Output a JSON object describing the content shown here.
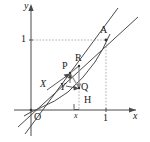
{
  "figure": {
    "background_color": "#ffffff",
    "stroke_color": "#444444",
    "dashed_color": "#9a9a9a",
    "axes": {
      "x_label": "x",
      "y_label": "y",
      "origin_label": "O",
      "x_tick_label": "1",
      "y_tick_label": "1",
      "x_small_label": "x"
    },
    "points": [
      {
        "key": "A",
        "label": "A",
        "x": 106,
        "y": 40,
        "label_x": 101,
        "label_y": 26
      },
      {
        "key": "R",
        "label": "R",
        "x": 79,
        "y": 65,
        "label_x": 76,
        "label_y": 54
      },
      {
        "key": "P",
        "label": "P",
        "x": 70,
        "y": 72,
        "label_x": 64,
        "label_y": 62
      },
      {
        "key": "Q",
        "label": "Q",
        "x": 79,
        "y": 87,
        "label_x": 81,
        "label_y": 82
      },
      {
        "key": "H",
        "label": "H",
        "x": 79,
        "y": 110,
        "label_x": 85,
        "label_y": 96
      },
      {
        "key": "O",
        "label": "O",
        "x": 31,
        "y": 110,
        "label_x": 34,
        "label_y": 113
      }
    ],
    "vectors": [
      {
        "key": "X",
        "label": "X",
        "label_x": 41,
        "label_y": 80,
        "from_x": 47,
        "from_y": 89,
        "to_x": 69,
        "to_y": 75
      },
      {
        "key": "Y",
        "label": "Y",
        "label_x": 61,
        "label_y": 83,
        "from_x": 66,
        "from_y": 86,
        "to_x": 78,
        "to_y": 88
      }
    ],
    "ticks": {
      "y_one_label_x": 21,
      "y_one_label_y": 35,
      "x_one_label_x": 103,
      "x_one_label_y": 113,
      "x_small_label_x": 74,
      "x_small_label_y": 112
    },
    "axis_label_positions": {
      "y_label_x": 25,
      "y_label_y": 2,
      "x_label_x": 133,
      "x_label_y": 112
    }
  }
}
